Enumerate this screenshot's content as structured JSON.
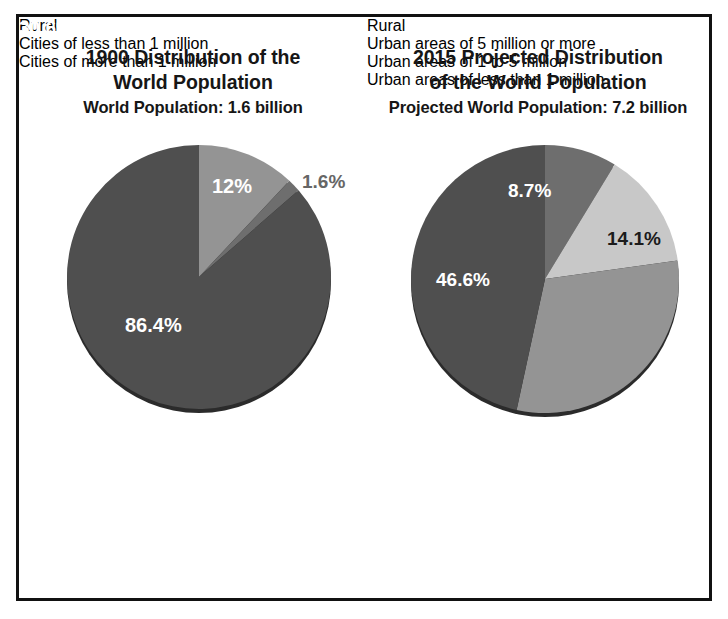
{
  "figure": {
    "background": "#ffffff",
    "border_color": "#111111"
  },
  "palette": {
    "dark_gray": "#4f4f4f",
    "mid_gray": "#949494",
    "light_gray": "#c8c8c8",
    "medium_dark_gray": "#6e6e6e",
    "label_white": "#ffffff",
    "label_black": "#1b1b1b",
    "label_outside": "#666666"
  },
  "panels": [
    {
      "id": "1900",
      "title_line1": "1900 Distribution of the",
      "title_line2": "World Population",
      "subtitle": "World Population: 1.6 billion"
    },
    {
      "id": "2015",
      "title_line1": "2015 Projected Distribution",
      "title_line2": "of the World Population",
      "subtitle": "Projected World Population: 7.2 billion"
    }
  ],
  "chart_data": [
    {
      "type": "pie",
      "title": "1900 Distribution of the World Population",
      "subtitle": "World Population: 1.6 billion",
      "total_population": "1.6 billion",
      "year": "1900",
      "categories": [
        "Rural",
        "Cities of less than 1 million",
        "Cities of more than 1 million"
      ],
      "values": [
        86.4,
        12,
        1.6
      ],
      "value_labels": [
        "86.4%",
        "12%",
        "1.6%"
      ],
      "colors": [
        "#4f4f4f",
        "#949494",
        "#6e6e6e"
      ],
      "label_colors": [
        "#ffffff",
        "#ffffff",
        "#666666"
      ],
      "legend_position": "bottom-left",
      "start_angle_deg": 0,
      "direction": "clockwise"
    },
    {
      "type": "pie",
      "title": "2015 Projected Distribution of the World Population",
      "subtitle": "Projected World Population: 7.2 billion",
      "total_population": "7.2 billion",
      "year": "2015",
      "categories": [
        "Rural",
        "Urban areas of 5 million or more",
        "Urban areas of 1 to 5 million",
        "Urban areas of less than 1 million"
      ],
      "values": [
        46.6,
        8.7,
        14.1,
        30.6
      ],
      "value_labels": [
        "46.6%",
        "8.7%",
        "14.1%",
        "30.6%"
      ],
      "colors": [
        "#4f4f4f",
        "#6e6e6e",
        "#c8c8c8",
        "#949494"
      ],
      "label_colors": [
        "#ffffff",
        "#ffffff",
        "#1b1b1b",
        "#ffffff"
      ],
      "legend_position": "bottom-left",
      "start_angle_deg": 0,
      "direction": "clockwise"
    }
  ],
  "legends": {
    "legend_1900": [
      {
        "label": "Rural",
        "color": "#4f4f4f"
      },
      {
        "label": "Cities of less than 1 million",
        "color": "#949494"
      },
      {
        "label": "Cities of more than 1 million",
        "color": "#6e6e6e"
      }
    ],
    "legend_2015": [
      {
        "label": "Rural",
        "color": "#4f4f4f"
      },
      {
        "label": "Urban areas of 5 million or more",
        "color": "#6e6e6e"
      },
      {
        "label": "Urban areas of 1 to 5 million",
        "color": "#c8c8c8"
      },
      {
        "label": "Urban areas of less than 1 million",
        "color": "#949494"
      }
    ]
  }
}
